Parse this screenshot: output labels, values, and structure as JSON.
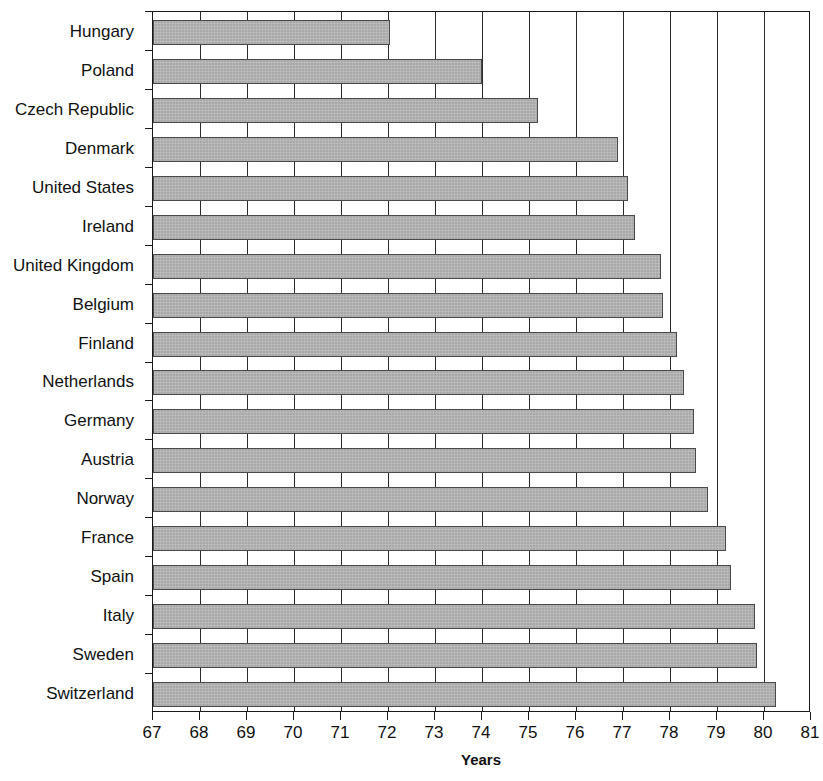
{
  "chart_data": {
    "type": "bar",
    "orientation": "horizontal",
    "title": "",
    "subtitle": "",
    "xlabel": "Years",
    "ylabel": "",
    "xlim": [
      67,
      81
    ],
    "xticks": [
      67,
      68,
      69,
      70,
      71,
      72,
      73,
      74,
      75,
      76,
      77,
      78,
      79,
      80,
      81
    ],
    "xtick_labels": [
      "67",
      "68",
      "69",
      "70",
      "71",
      "72",
      "73",
      "74",
      "75",
      "76",
      "77",
      "78",
      "79",
      "80",
      "81"
    ],
    "grid": true,
    "grid_axis": "x",
    "legend": null,
    "bar_color": "#a9a9a9",
    "bar_edge_color": "#4a4a4a",
    "categories": [
      "Hungary",
      "Poland",
      "Czech Republic",
      "Denmark",
      "United States",
      "Ireland",
      "United Kingdom",
      "Belgium",
      "Finland",
      "Netherlands",
      "Germany",
      "Austria",
      "Norway",
      "France",
      "Spain",
      "Italy",
      "Sweden",
      "Switzerland"
    ],
    "values": [
      72.05,
      74.0,
      75.2,
      76.9,
      77.1,
      77.25,
      77.8,
      77.85,
      78.15,
      78.3,
      78.5,
      78.55,
      78.8,
      79.2,
      79.3,
      79.8,
      79.85,
      80.25
    ]
  }
}
